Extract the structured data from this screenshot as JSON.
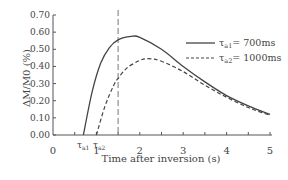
{
  "chart_data": {
    "type": "line",
    "title": "",
    "xlabel": "Time after inversion (s)",
    "ylabel": "ΔM/M0 (%)",
    "xlim": [
      0,
      5
    ],
    "ylim": [
      0,
      0.7
    ],
    "x_ticks": [
      "0",
      "1",
      "2",
      "3",
      "4",
      "5"
    ],
    "y_ticks": [
      "0.00",
      "0.10",
      "0.20",
      "0.30",
      "0.40",
      "0.50",
      "0.60",
      "0.70"
    ],
    "grid": false,
    "legend_position": "upper right",
    "annotations": [
      {
        "text": "τa1",
        "x": 0.7
      },
      {
        "text": "τa2",
        "x": 1.0
      },
      {
        "type": "vertical-dashed-line",
        "x": 1.5
      }
    ],
    "series": [
      {
        "name": "τa1= 700ms",
        "style": "solid",
        "x": [
          0.7,
          0.9,
          1.1,
          1.3,
          1.5,
          1.8,
          2.0,
          2.5,
          3.0,
          3.5,
          4.0,
          4.5,
          5.0
        ],
        "y": [
          0.0,
          0.25,
          0.42,
          0.51,
          0.555,
          0.575,
          0.57,
          0.5,
          0.4,
          0.31,
          0.23,
          0.17,
          0.12
        ]
      },
      {
        "name": "τa2= 1000ms",
        "style": "dashed",
        "x": [
          1.0,
          1.2,
          1.4,
          1.5,
          1.7,
          2.0,
          2.2,
          2.5,
          3.0,
          3.5,
          4.0,
          4.5,
          5.0
        ],
        "y": [
          0.0,
          0.17,
          0.29,
          0.33,
          0.39,
          0.435,
          0.445,
          0.43,
          0.37,
          0.29,
          0.22,
          0.16,
          0.115
        ]
      }
    ]
  },
  "legend": {
    "items": [
      {
        "label": "τ",
        "sub": "a1",
        "suffix": "= 700ms"
      },
      {
        "label": "τ",
        "sub": "a2",
        "suffix": "= 1000ms"
      }
    ]
  },
  "labels": {
    "tau_a1": "τ",
    "tau_a1_sub": "a1",
    "tau_a2": "τ",
    "tau_a2_sub": "a2"
  }
}
